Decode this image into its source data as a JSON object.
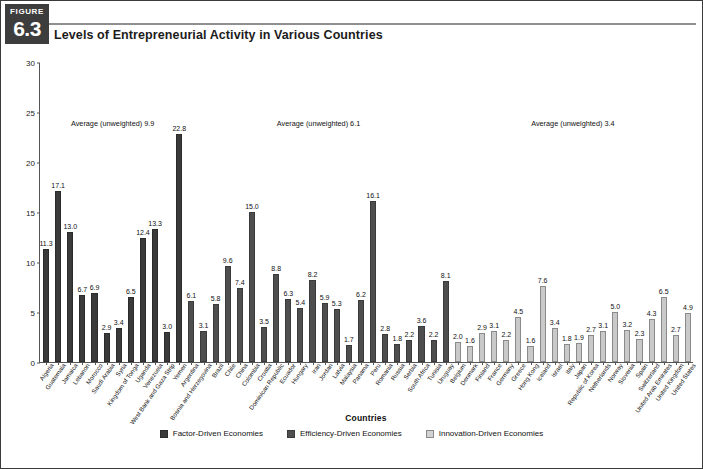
{
  "figure": {
    "badge_word": "FIGURE",
    "badge_number": "6.3",
    "title": "Levels of Entrepreneurial Activity in Various Countries"
  },
  "legend": {
    "items": [
      {
        "label": "Factor-Driven Economies",
        "key": "factor",
        "color": "#3a3a3a"
      },
      {
        "label": "Efficiency-Driven Economies",
        "key": "efficiency",
        "color": "#4e4e4e"
      },
      {
        "label": "Innovation-Driven Economies",
        "key": "innovation",
        "color": "#d2d2d2"
      }
    ]
  },
  "annotations": [
    {
      "text": "Average (unweighted) 9.9",
      "group": "factor"
    },
    {
      "text": "Average (unweighted) 6.1",
      "group": "efficiency"
    },
    {
      "text": "Average (unweighted) 3.4",
      "group": "innovation"
    }
  ],
  "chart_data": {
    "type": "bar",
    "title": "Levels of Entrepreneurial Activity in Various Countries",
    "xlabel": "Countries",
    "ylabel": "Total Entrepreneurial Activity",
    "ylim": [
      0,
      30
    ],
    "yticks": [
      0,
      5,
      10,
      15,
      20,
      25,
      30
    ],
    "grid": false,
    "legend_position": "bottom",
    "categories": [
      "Algeria",
      "Guatemala",
      "Jamaica",
      "Lebanon",
      "Morocco",
      "Saudi Arabia",
      "Syria",
      "Kingdom of Tonga",
      "Uganda",
      "Venezuela",
      "West Bank and Gaza Strip",
      "Yemen",
      "Argentina",
      "Bosnia and Herzegovina",
      "Brazil",
      "Chile",
      "China",
      "Colombia",
      "Croatia",
      "Dominican Republic",
      "Ecuador",
      "Hungary",
      "Iran",
      "Jordan",
      "Latvia",
      "Malaysia",
      "Panama",
      "Peru",
      "Romania",
      "Russia",
      "Serbia",
      "South Africa",
      "Tunisia",
      "Uruguay",
      "Belgium",
      "Denmark",
      "Finland",
      "France",
      "Germany",
      "Greece",
      "Hong Kong",
      "Iceland",
      "Israel",
      "Italy",
      "Japan",
      "Republic of Korea",
      "Netherlands",
      "Norway",
      "Slovenia",
      "Spain",
      "Switzerland",
      "United Arab Emirates",
      "United Kingdom",
      "United States"
    ],
    "values": [
      11.3,
      17.1,
      13.0,
      6.7,
      6.9,
      2.9,
      3.4,
      6.5,
      12.4,
      13.3,
      3.0,
      22.8,
      6.1,
      3.1,
      5.8,
      9.6,
      7.4,
      15.0,
      3.5,
      8.8,
      6.3,
      5.4,
      8.2,
      5.9,
      5.3,
      1.7,
      6.2,
      16.1,
      2.8,
      1.8,
      2.2,
      3.6,
      2.2,
      8.1,
      2.0,
      1.6,
      2.9,
      3.1,
      2.2,
      4.5,
      1.6,
      7.6,
      3.4,
      1.8,
      1.9,
      2.7,
      3.1,
      5.0,
      3.2,
      2.3,
      4.3,
      6.5,
      2.7,
      4.9
    ],
    "groups": [
      "factor",
      "factor",
      "factor",
      "factor",
      "factor",
      "factor",
      "factor",
      "factor",
      "factor",
      "factor",
      "factor",
      "factor",
      "efficiency",
      "efficiency",
      "efficiency",
      "efficiency",
      "efficiency",
      "efficiency",
      "efficiency",
      "efficiency",
      "efficiency",
      "efficiency",
      "efficiency",
      "efficiency",
      "efficiency",
      "efficiency",
      "efficiency",
      "efficiency",
      "efficiency",
      "efficiency",
      "efficiency",
      "efficiency",
      "efficiency",
      "efficiency",
      "innovation",
      "innovation",
      "innovation",
      "innovation",
      "innovation",
      "innovation",
      "innovation",
      "innovation",
      "innovation",
      "innovation",
      "innovation",
      "innovation",
      "innovation",
      "innovation",
      "innovation",
      "innovation",
      "innovation",
      "innovation",
      "innovation",
      "innovation"
    ],
    "group_averages": {
      "factor": 9.9,
      "efficiency": 6.1,
      "innovation": 3.4
    }
  }
}
